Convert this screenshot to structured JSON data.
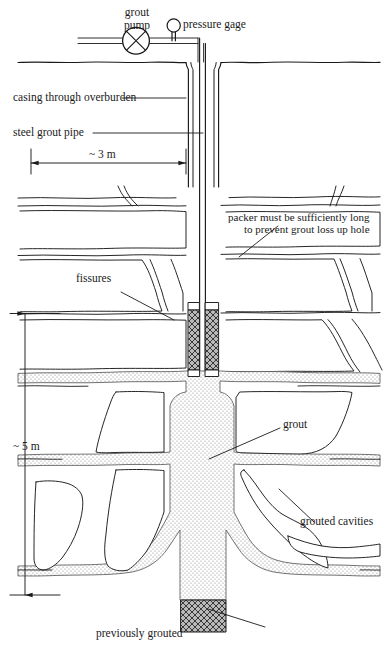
{
  "figure": {
    "type": "engineering-cross-section-diagram",
    "background_color": "#ffffff",
    "line_color": "#1a1a1a",
    "grout_fill_color": "#d8d8d8",
    "packer_fill_color": "#8c8c8c"
  },
  "labels": {
    "grout_pump_line1": "grout",
    "grout_pump_line2": "pump",
    "pressure_gage": "pressure gage",
    "casing": "casing through overburden",
    "steel_grout_pipe": "steel grout pipe",
    "dim_horizontal": "~ 3 m",
    "dim_vertical": "~ 5 m",
    "packer_note_line1": "packer must be sufficiently long",
    "packer_note_line2": "to prevent grout loss up hole",
    "fissures": "fissures",
    "grout": "grout",
    "grouted_cavities": "grouted cavities",
    "previously_grouted": "previously grouted"
  },
  "dimensions": {
    "horizontal_value": "~ 3 m",
    "horizontal_meaning": "distance from left edge of section to borehole",
    "vertical_value": "~ 5 m",
    "vertical_meaning": "grouted stage length below packer"
  },
  "icons": {
    "grout_pump": "pump-circle-cross-icon",
    "pressure_gage": "gage-circle-icon"
  }
}
